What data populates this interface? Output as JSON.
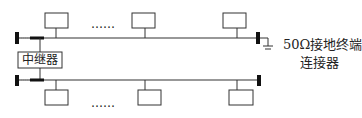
{
  "diagram": {
    "type": "bus-network-with-repeater",
    "repeater_label": "中继器",
    "terminator_label_line1": "50Ω接地终端",
    "terminator_label_line2": "连接器",
    "ellipsis_top": "……",
    "ellipsis_bottom": "……",
    "segments": [
      {
        "name": "upper-segment",
        "stations": 3,
        "terminators": [
          "left",
          "right-grounded"
        ]
      },
      {
        "name": "lower-segment",
        "stations": 3,
        "terminators": [
          "left",
          "right"
        ]
      }
    ],
    "colors": {
      "line": "#333333",
      "background": "#ffffff"
    }
  }
}
